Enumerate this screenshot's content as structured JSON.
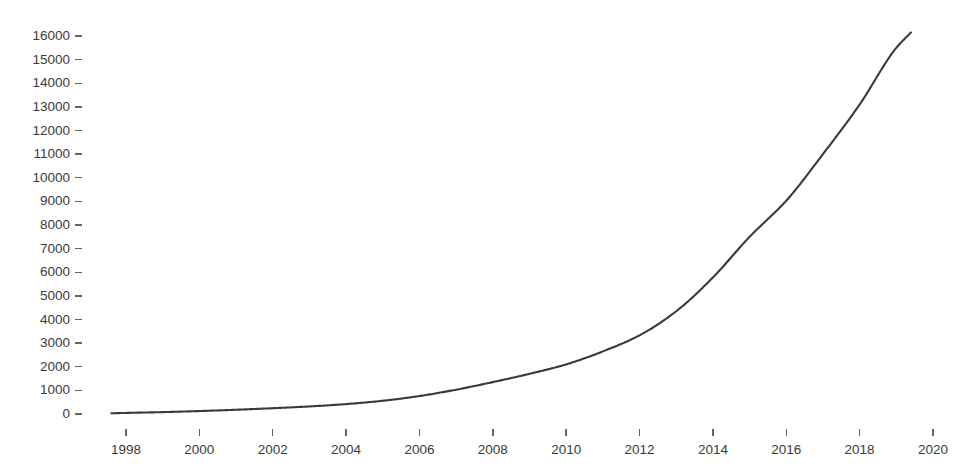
{
  "chart_data": {
    "type": "line",
    "title": "",
    "subtitle": "",
    "xlabel": "",
    "ylabel": "",
    "xlim": [
      1996.5,
      2020.8
    ],
    "ylim": [
      0,
      16400
    ],
    "grid": false,
    "legend": null,
    "legend_position": "none",
    "line_color": "#3a3a3a",
    "line_width": 2.1,
    "background_color": "#ffffff",
    "axis_text_color": "#3b3b3b",
    "tick_color": "#666666",
    "x_tick_labels": [
      "1998",
      "2000",
      "2002",
      "2004",
      "2006",
      "2008",
      "2010",
      "2012",
      "2014",
      "2016",
      "2018",
      "2020"
    ],
    "x_tick_values": [
      1998,
      2000,
      2002,
      2004,
      2006,
      2008,
      2010,
      2012,
      2014,
      2016,
      2018,
      2020
    ],
    "y_tick_labels": [
      "0",
      "1000",
      "2000",
      "3000",
      "4000",
      "5000",
      "6000",
      "7000",
      "8000",
      "9000",
      "10000",
      "11000",
      "12000",
      "13000",
      "14000",
      "15000",
      "16000"
    ],
    "y_tick_values": [
      0,
      1000,
      2000,
      3000,
      4000,
      5000,
      6000,
      7000,
      8000,
      9000,
      10000,
      11000,
      12000,
      13000,
      14000,
      15000,
      16000
    ],
    "series": [
      {
        "name": "series-1",
        "x": [
          1997.6,
          1998,
          1999,
          2000,
          2001,
          2002,
          2003,
          2004,
          2005,
          2006,
          2007,
          2008,
          2009,
          2010,
          2011,
          2012,
          2013,
          2014,
          2015,
          2016,
          2017,
          2018,
          2019,
          2019.4
        ],
        "values": [
          30,
          45,
          80,
          125,
          180,
          245,
          320,
          420,
          560,
          760,
          1030,
          1350,
          1700,
          2100,
          2650,
          3330,
          4350,
          5780,
          7500,
          9030,
          11000,
          13100,
          15500,
          16150
        ]
      }
    ]
  }
}
